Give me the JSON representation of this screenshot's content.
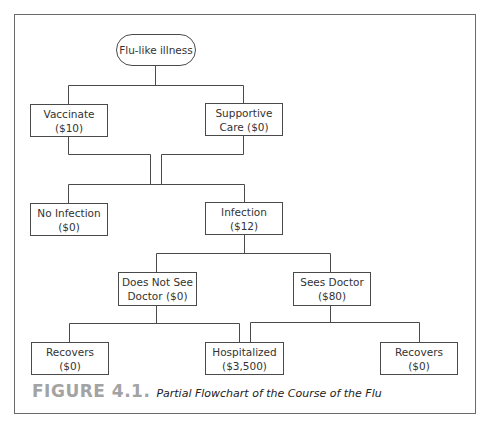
{
  "figure": {
    "label": "FIGURE 4.1.",
    "title": "Partial Flowchart of the Course of the Flu"
  },
  "nodes": {
    "root": {
      "line1": "Flu-like illness"
    },
    "vaccinate": {
      "line1": "Vaccinate",
      "line2": "($10)"
    },
    "supportive": {
      "line1": "Supportive",
      "line2": "Care ($0)"
    },
    "no_infection": {
      "line1": "No Infection",
      "line2": "($0)"
    },
    "infection": {
      "line1": "Infection",
      "line2": "($12)"
    },
    "no_doctor": {
      "line1": "Does Not See",
      "line2": "Doctor ($0)"
    },
    "sees_doctor": {
      "line1": "Sees Doctor",
      "line2": "($80)"
    },
    "recovers_left": {
      "line1": "Recovers",
      "line2": "($0)"
    },
    "hospitalized": {
      "line1": "Hospitalized",
      "line2": "($3,500)"
    },
    "recovers_right": {
      "line1": "Recovers",
      "line2": "($0)"
    }
  },
  "edges": [
    {
      "from": "Flu-like illness",
      "to": "Vaccinate ($10)"
    },
    {
      "from": "Flu-like illness",
      "to": "Supportive Care ($0)"
    },
    {
      "from": "Vaccinate ($10)",
      "to": "No Infection / Infection"
    },
    {
      "from": "Supportive Care ($0)",
      "to": "No Infection / Infection"
    },
    {
      "from": "Infection ($12)",
      "to": "Does Not See Doctor ($0)"
    },
    {
      "from": "Infection ($12)",
      "to": "Sees Doctor ($80)"
    },
    {
      "from": "Does Not See Doctor ($0)",
      "to": "Recovers ($0)"
    },
    {
      "from": "Does Not See Doctor ($0)",
      "to": "Hospitalized ($3,500)"
    },
    {
      "from": "Sees Doctor ($80)",
      "to": "Hospitalized ($3,500)"
    },
    {
      "from": "Sees Doctor ($80)",
      "to": "Recovers ($0)"
    }
  ],
  "colors": {
    "line": "#4a4a4a",
    "frame": "#6a6a6a",
    "figure_label": "#a3a3a3"
  }
}
